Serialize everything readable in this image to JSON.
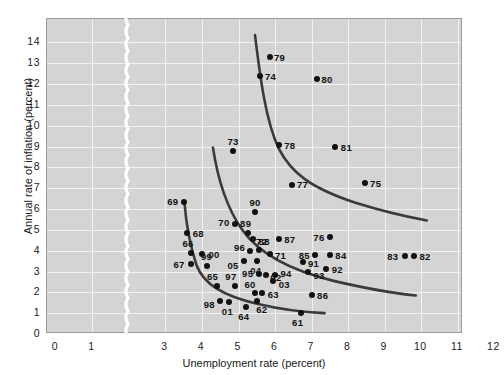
{
  "chart_data": {
    "type": "scatter",
    "title": "",
    "xlabel": "Unemployment rate (percent)",
    "ylabel": "Annual rate of inflation (percent)",
    "xlim": [
      0,
      12.6
    ],
    "ylim": [
      0,
      14.8
    ],
    "xticks": [
      0,
      1,
      3,
      4,
      5,
      6,
      7,
      8,
      9,
      10,
      11,
      12
    ],
    "yticks": [
      0,
      1,
      2,
      3,
      4,
      5,
      6,
      7,
      8,
      9,
      10,
      11,
      12,
      13,
      14
    ],
    "grid": true,
    "legend": "none",
    "axis_break": {
      "present": true,
      "between": [
        1,
        3
      ],
      "style": "wavy-white-line"
    },
    "point_color": "#111111",
    "curve_color": "#3a3a3a",
    "plot_bg": "#d4d4d4",
    "gridline_color": "#f2f2f2",
    "points": [
      {
        "label": "79",
        "x": 5.85,
        "y": 13.3
      },
      {
        "label": "74",
        "x": 5.6,
        "y": 12.4
      },
      {
        "label": "80",
        "x": 7.15,
        "y": 12.25
      },
      {
        "label": "73",
        "x": 4.85,
        "y": 8.8
      },
      {
        "label": "78",
        "x": 6.1,
        "y": 9.05
      },
      {
        "label": "81",
        "x": 7.65,
        "y": 9.0
      },
      {
        "label": "77",
        "x": 6.45,
        "y": 7.15
      },
      {
        "label": "75",
        "x": 8.45,
        "y": 7.25
      },
      {
        "label": "69",
        "x": 3.5,
        "y": 6.35
      },
      {
        "label": "90",
        "x": 5.45,
        "y": 5.85
      },
      {
        "label": "70",
        "x": 4.9,
        "y": 5.3
      },
      {
        "label": "68",
        "x": 3.6,
        "y": 4.85
      },
      {
        "label": "89",
        "x": 5.25,
        "y": 4.85
      },
      {
        "label": "88",
        "x": 5.4,
        "y": 4.55
      },
      {
        "label": "87",
        "x": 6.1,
        "y": 4.55
      },
      {
        "label": "76",
        "x": 7.5,
        "y": 4.65
      },
      {
        "label": "66",
        "x": 3.7,
        "y": 3.9
      },
      {
        "label": "00",
        "x": 4.0,
        "y": 3.85
      },
      {
        "label": "96",
        "x": 5.3,
        "y": 4.0
      },
      {
        "label": "72",
        "x": 5.55,
        "y": 4.05
      },
      {
        "label": "71",
        "x": 5.85,
        "y": 3.85
      },
      {
        "label": "85",
        "x": 7.1,
        "y": 3.8
      },
      {
        "label": "84",
        "x": 7.5,
        "y": 3.8
      },
      {
        "label": "91",
        "x": 6.75,
        "y": 3.45
      },
      {
        "label": "67",
        "x": 3.7,
        "y": 3.35
      },
      {
        "label": "99",
        "x": 4.15,
        "y": 3.25
      },
      {
        "label": "05",
        "x": 5.15,
        "y": 3.5
      },
      {
        "label": "04",
        "x": 5.5,
        "y": 3.5
      },
      {
        "label": "92",
        "x": 7.4,
        "y": 3.1
      },
      {
        "label": "93",
        "x": 6.9,
        "y": 3.0
      },
      {
        "label": "95",
        "x": 5.55,
        "y": 2.9
      },
      {
        "label": "02",
        "x": 5.75,
        "y": 2.85
      },
      {
        "label": "94",
        "x": 6.0,
        "y": 2.85
      },
      {
        "label": "03",
        "x": 5.95,
        "y": 2.55
      },
      {
        "label": "65",
        "x": 4.4,
        "y": 2.3
      },
      {
        "label": "97",
        "x": 4.9,
        "y": 2.3
      },
      {
        "label": "83",
        "x": 9.55,
        "y": 3.75
      },
      {
        "label": "82",
        "x": 9.8,
        "y": 3.75
      },
      {
        "label": "60",
        "x": 5.45,
        "y": 1.95
      },
      {
        "label": "63",
        "x": 5.65,
        "y": 1.95
      },
      {
        "label": "62",
        "x": 5.5,
        "y": 1.6
      },
      {
        "label": "98",
        "x": 4.5,
        "y": 1.6
      },
      {
        "label": "01",
        "x": 4.75,
        "y": 1.55
      },
      {
        "label": "64",
        "x": 5.2,
        "y": 1.3
      },
      {
        "label": "86",
        "x": 7.0,
        "y": 1.85
      },
      {
        "label": "61",
        "x": 6.7,
        "y": 1.0
      }
    ],
    "curves": [
      {
        "name": "phillips-curve-1970s",
        "path": "M 5.45 14.35 C 5.6 12.2 5.75 10.2 6.1 8.9 C 6.45 7.7 7.0 7.0 8.2 6.3 C 9.2 5.75 10.0 5.5 10.15 5.45"
      },
      {
        "name": "phillips-curve-1960s-shift",
        "path": "M 4.3 8.95 C 4.45 7.2 4.7 6.0 5.1 5.0 C 5.5 4.0 6.3 3.1 7.6 2.55 C 8.7 2.1 9.55 1.9 9.85 1.85"
      },
      {
        "name": "phillips-curve-original",
        "path": "M 3.52 6.3 C 3.58 5.0 3.7 4.1 3.85 3.3 C 4.05 2.4 4.55 1.85 5.5 1.45 C 6.1 1.2 6.7 1.05 7.35 1.0"
      }
    ]
  }
}
